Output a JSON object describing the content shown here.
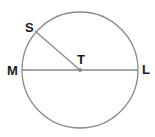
{
  "diagram": {
    "type": "circle-geometry",
    "circle": {
      "center_label": "T",
      "cx": 80,
      "cy": 70,
      "r": 58,
      "stroke": "#8a8a8a"
    },
    "points": [
      {
        "label": "S",
        "x": 34,
        "y": 33,
        "role": "point on circle"
      },
      {
        "label": "T",
        "x": 80,
        "y": 70,
        "role": "center"
      },
      {
        "label": "M",
        "x": 22,
        "y": 70,
        "role": "point on circle"
      },
      {
        "label": "L",
        "x": 138,
        "y": 70,
        "role": "point on circle"
      }
    ],
    "segments": [
      {
        "from": "M",
        "to": "L",
        "type": "diameter"
      },
      {
        "from": "S",
        "to": "T",
        "type": "radius"
      }
    ],
    "labels": {
      "S": "S",
      "T": "T",
      "M": "M",
      "L": "L"
    },
    "colors": {
      "line": "#8a8a8a",
      "text": "#1a1a1a",
      "center_dot": "#8a8a8a"
    }
  }
}
